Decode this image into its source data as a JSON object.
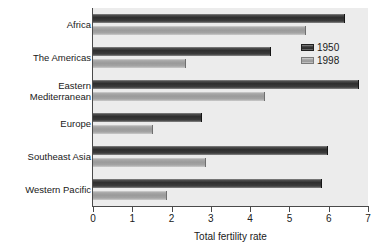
{
  "chart_data": {
    "type": "bar",
    "orientation": "horizontal",
    "title": "",
    "xlabel": "Total fertility rate",
    "ylabel": "",
    "xlim": [
      0,
      7
    ],
    "xticks": [
      "0",
      "1",
      "2",
      "3",
      "4",
      "5",
      "6",
      "7"
    ],
    "grid": false,
    "legend_position": "top-right",
    "categories": [
      "Africa",
      "The Americas",
      "Eastern\nMediterranean",
      "Europe",
      "Southeast Asia",
      "Western Pacific"
    ],
    "series": [
      {
        "name": "1950",
        "color": "#2e2e2e",
        "values": [
          6.4,
          4.5,
          6.75,
          2.75,
          5.95,
          5.8
        ]
      },
      {
        "name": "1998",
        "color": "#a0a0a0",
        "values": [
          5.4,
          2.35,
          4.35,
          1.5,
          2.85,
          1.85
        ]
      }
    ]
  },
  "legend": {
    "entries": [
      {
        "label": "1950"
      },
      {
        "label": "1998"
      }
    ]
  },
  "axis": {
    "x_title": "Total fertility rate"
  },
  "colors": {
    "plot_background": "#ececec",
    "page_background": "#ffffff",
    "axis_line": "#4a4a4a",
    "series_1950": "#2e2e2e",
    "series_1998": "#a0a0a0"
  }
}
